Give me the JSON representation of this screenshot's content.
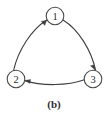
{
  "figure": {
    "caption": "(b)",
    "caption_x": 54,
    "caption_y": 104,
    "width": 109,
    "height": 116,
    "background_color": "#ffffff",
    "stroke_color": "#3f3f42",
    "node_fill_color": "#ffffff",
    "node_stroke_color": "#4a4a4d",
    "text_color": "#2e2e31"
  },
  "graph": {
    "type": "directed-graph",
    "node_radius": 8.8,
    "nodes": [
      {
        "id": "1",
        "label": "1",
        "cx": 55,
        "cy": 16
      },
      {
        "id": "2",
        "label": "2",
        "cx": 16,
        "cy": 79
      },
      {
        "id": "3",
        "label": "3",
        "cx": 93,
        "cy": 79
      }
    ],
    "edges": [
      {
        "id": "edge-2-to-1",
        "from": "2",
        "to": "1",
        "label": "",
        "path": "M 13.6 70.5 C 18.0 50.0 32.0 29.0 46.6 20.2",
        "arrow": "M 46.6 20.2 L 41.2 21.4 L 44.8 25.4 Z"
      },
      {
        "id": "edge-1-to-3",
        "from": "1",
        "to": "3",
        "label": "",
        "path": "M 63.4 20.2 C 78.0 29.0 91.6 50.5 95.6 70.5",
        "arrow": "M 95.6 70.5 L 90.4 65.8 L 94.0 65.0 Z"
      },
      {
        "id": "edge-3-to-2",
        "from": "3",
        "to": "2",
        "label": "",
        "path": "M 84.2 79.8 C 68.0 86.0 41.0 86.0 24.8 80.6",
        "arrow": "M 24.8 80.6 L 30.6 79.4 L 30.0 83.4 Z"
      }
    ]
  }
}
